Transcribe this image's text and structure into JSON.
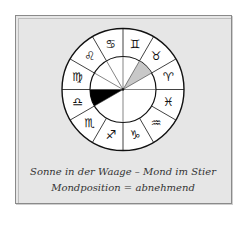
{
  "caption": {
    "line1": "Sonne in der Waage – Mond im Stier",
    "line2": "Mondposition = abnehmend"
  },
  "wheel": {
    "center": [
      123,
      89.5
    ],
    "outer_radius": 61,
    "inner_radius": 33,
    "signs": [
      {
        "name": "aries",
        "glyph": "♈"
      },
      {
        "name": "taurus",
        "glyph": "♉"
      },
      {
        "name": "gemini",
        "glyph": "♊"
      },
      {
        "name": "cancer",
        "glyph": "♋"
      },
      {
        "name": "leo",
        "glyph": "♌"
      },
      {
        "name": "virgo",
        "glyph": "♍"
      },
      {
        "name": "libra",
        "glyph": "♎"
      },
      {
        "name": "scorpio",
        "glyph": "♏"
      },
      {
        "name": "sagittarius",
        "glyph": "♐"
      },
      {
        "name": "capricorn",
        "glyph": "♑"
      },
      {
        "name": "aquarius",
        "glyph": "♒"
      },
      {
        "name": "pisces",
        "glyph": "♓"
      }
    ],
    "sun_sector": "libra",
    "moon_sector": "taurus",
    "colors": {
      "sun": "#000000",
      "moon": "#c8c8c8",
      "background": "#e6e6e6",
      "disc": "#ffffff"
    }
  }
}
